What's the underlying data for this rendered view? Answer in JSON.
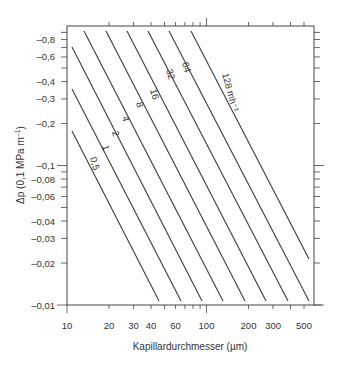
{
  "chart_data": {
    "type": "line",
    "title": "",
    "xlabel": "Kapillardurchmesser (µm)",
    "ylabel": "Δp (0,1 MPa m⁻¹)",
    "xscale": "log",
    "yscale": "log",
    "xlim": [
      10,
      600
    ],
    "ylim": [
      -0.01,
      -1.0
    ],
    "grid": false,
    "legend": "inline labels on lines",
    "x_ticks": [
      10,
      20,
      30,
      40,
      60,
      100,
      200,
      300,
      500
    ],
    "x_tick_labels": [
      "10",
      "20",
      "30",
      "40",
      "60",
      "100",
      "200",
      "300",
      "500"
    ],
    "y_ticks": [
      -0.8,
      -0.6,
      -0.4,
      -0.3,
      -0.2,
      -0.1,
      -0.08,
      -0.06,
      -0.04,
      -0.03,
      -0.02,
      -0.01
    ],
    "y_tick_labels": [
      "–0,8",
      "–0,6",
      "–0,4",
      "–0,3",
      "–0,2",
      "–0,1",
      "–0,08",
      "–0,06",
      "–0,04",
      "–0,03",
      "–0,02",
      "–0,01"
    ],
    "series_unit": "mh⁻¹",
    "series": [
      {
        "name": "0,5",
        "label": "0,5",
        "x": [
          10.4,
          43
        ],
        "y": [
          -0.15,
          -0.0107
        ]
      },
      {
        "name": "1",
        "label": "1",
        "x": [
          10.4,
          61
        ],
        "y": [
          -0.3,
          -0.0107
        ]
      },
      {
        "name": "2",
        "label": "2",
        "x": [
          10.4,
          87
        ],
        "y": [
          -0.61,
          -0.0107
        ]
      },
      {
        "name": "4",
        "label": "4",
        "x": [
          12.4,
          123
        ],
        "y": [
          -0.92,
          -0.0107
        ]
      },
      {
        "name": "8",
        "label": "8",
        "x": [
          17.4,
          174
        ],
        "y": [
          -0.92,
          -0.0107
        ]
      },
      {
        "name": "16",
        "label": "16",
        "x": [
          24.5,
          245
        ],
        "y": [
          -0.92,
          -0.0107
        ]
      },
      {
        "name": "32",
        "label": "32",
        "x": [
          34.5,
          345
        ],
        "y": [
          -0.92,
          -0.0107
        ]
      },
      {
        "name": "64",
        "label": "64",
        "x": [
          49,
          490
        ],
        "y": [
          -0.92,
          -0.0107
        ]
      },
      {
        "name": "128",
        "label": "128 mh⁻¹",
        "x": [
          70,
          575
        ],
        "y": [
          -0.92,
          -0.0107
        ]
      }
    ]
  },
  "axes": {
    "x_title": "Kapillardurchmesser (µm)",
    "y_title": "Δp (0,1 MPa m",
    "y_title_sup": "–1",
    "y_title_close": ")"
  }
}
